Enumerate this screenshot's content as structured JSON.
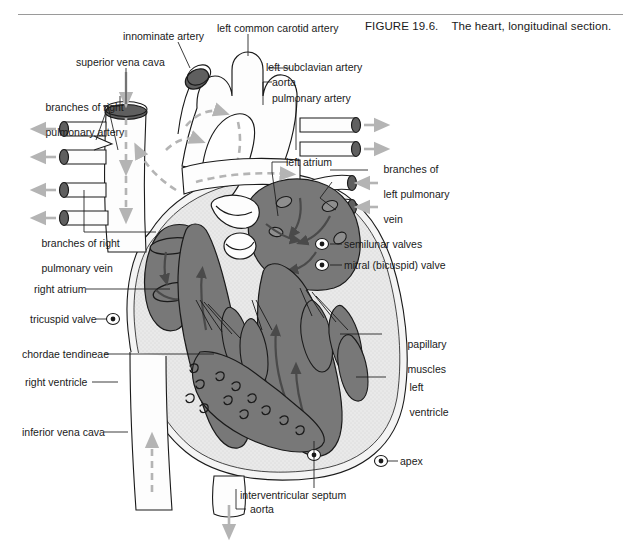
{
  "figure": {
    "number": "FIGURE 19.6.",
    "caption": "The heart, longitudinal section."
  },
  "colors": {
    "blood": "#787878",
    "myocardium": "#e3e3e3",
    "vessel_fill": "#fdfdfd",
    "lumen": "#5f5f5f",
    "outline": "#1a1a1a",
    "flow_arrow": "#b4b4b4",
    "blood_arrow": "#4a4a4a",
    "rule": "#9a9a9a",
    "text": "#1a1a1a"
  },
  "labels": [
    {
      "id": "branches-of-right-pulmonary-artery",
      "text": "branches of right\npulmonary artery",
      "align": "left"
    },
    {
      "id": "superior-vena-cava",
      "text": "superior vena cava",
      "align": "left"
    },
    {
      "id": "innominate-artery",
      "text": "innominate artery",
      "align": "left"
    },
    {
      "id": "left-common-carotid-artery",
      "text": "left common carotid artery",
      "align": "left"
    },
    {
      "id": "left-subclavian-artery",
      "text": "left subclavian artery",
      "align": "left"
    },
    {
      "id": "aorta-arch",
      "text": "aorta",
      "align": "left"
    },
    {
      "id": "pulmonary-artery",
      "text": "pulmonary artery",
      "align": "left"
    },
    {
      "id": "left-atrium",
      "text": "left atrium",
      "align": "left"
    },
    {
      "id": "branches-of-left-pulmonary-vein",
      "text": "branches of\nleft pulmonary\nvein",
      "align": "left"
    },
    {
      "id": "branches-of-right-pulmonary-vein",
      "text": "branches of right\npulmonary vein",
      "align": "left"
    },
    {
      "id": "semilunar-valves",
      "text": "semilunar valves",
      "align": "left"
    },
    {
      "id": "mitral-bicuspid-valve",
      "text": "mitral (bicuspid) valve",
      "align": "left"
    },
    {
      "id": "right-atrium",
      "text": "right atrium",
      "align": "left"
    },
    {
      "id": "tricuspid-valve",
      "text": "tricuspid valve",
      "align": "left"
    },
    {
      "id": "papillary-muscles",
      "text": "papillary\nmuscles",
      "align": "left"
    },
    {
      "id": "chordae-tendineae",
      "text": "chordae tendineae",
      "align": "left"
    },
    {
      "id": "right-ventricle",
      "text": "right ventricle",
      "align": "left"
    },
    {
      "id": "left-ventricle",
      "text": "left\nventricle",
      "align": "left"
    },
    {
      "id": "inferior-vena-cava",
      "text": "inferior vena cava",
      "align": "left"
    },
    {
      "id": "apex",
      "text": "apex",
      "align": "left"
    },
    {
      "id": "interventricular-septum",
      "text": "interventricular septum",
      "align": "left"
    },
    {
      "id": "aorta-descending",
      "text": "aorta",
      "align": "left"
    }
  ],
  "label_text": {
    "branches_right_pulmonary_artery_1": "branches of right",
    "branches_right_pulmonary_artery_2": "pulmonary artery",
    "superior_vena_cava": "superior vena cava",
    "innominate_artery": "innominate artery",
    "left_common_carotid_artery": "left common carotid artery",
    "left_subclavian_artery": "left subclavian artery",
    "aorta_arch": "aorta",
    "pulmonary_artery": "pulmonary artery",
    "left_atrium": "left atrium",
    "branches_left_pulmonary_vein_1": "branches of",
    "branches_left_pulmonary_vein_2": "left pulmonary",
    "branches_left_pulmonary_vein_3": "vein",
    "branches_right_pulmonary_vein_1": "branches of right",
    "branches_right_pulmonary_vein_2": "pulmonary vein",
    "semilunar_valves": "semilunar valves",
    "mitral_bicuspid_valve": "mitral (bicuspid) valve",
    "right_atrium": "right atrium",
    "tricuspid_valve": "tricuspid valve",
    "papillary_muscles_1": "papillary",
    "papillary_muscles_2": "muscles",
    "chordae_tendineae": "chordae tendineae",
    "right_ventricle": "right ventricle",
    "left_ventricle_1": "left",
    "left_ventricle_2": "ventricle",
    "inferior_vena_cava": "inferior vena cava",
    "apex": "apex",
    "interventricular_septum": "interventricular septum",
    "aorta_descending": "aorta"
  }
}
